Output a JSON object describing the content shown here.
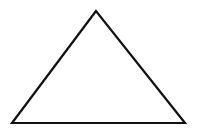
{
  "diagram": {
    "shape": "triangle",
    "kind": "outline",
    "stroke_color": "#111111",
    "fill_color": "none",
    "background_color": "#ffffff"
  }
}
